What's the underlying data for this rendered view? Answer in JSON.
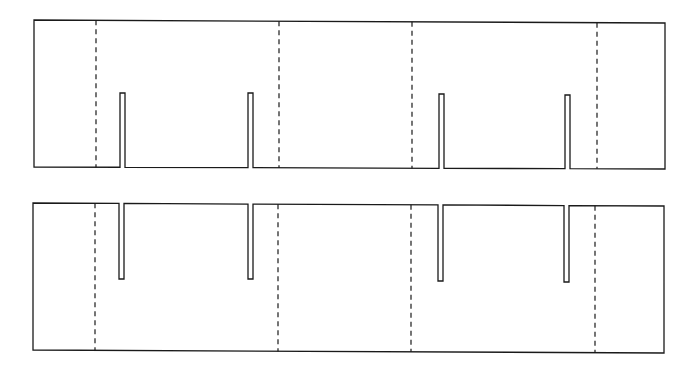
{
  "diagram": {
    "type": "die-cut template",
    "colors": {
      "line": "#1a1a1a",
      "background": "#ffffff"
    },
    "legend": {
      "cut_line": "solid",
      "fold_line": "dashed"
    },
    "panels": [
      {
        "id": "top-blank",
        "corners": {
          "tl": [
            34,
            20
          ],
          "tr": [
            665,
            23
          ],
          "br": [
            665,
            169
          ],
          "bl": [
            34,
            167
          ]
        },
        "slot_origin": "bottom",
        "slots": [
          {
            "x": 120,
            "w": 5,
            "tip_y": 93
          },
          {
            "x": 248,
            "w": 5,
            "tip_y": 93
          },
          {
            "x": 439,
            "w": 5,
            "tip_y": 94
          },
          {
            "x": 565,
            "w": 5,
            "tip_y": 95
          }
        ],
        "folds": [
          96,
          279,
          412,
          597
        ]
      },
      {
        "id": "bottom-blank",
        "corners": {
          "tl": [
            33,
            203
          ],
          "tr": [
            664,
            206
          ],
          "br": [
            664,
            353
          ],
          "bl": [
            33,
            350
          ]
        },
        "slot_origin": "top",
        "slots": [
          {
            "x": 119,
            "w": 5,
            "tip_y": 279
          },
          {
            "x": 248,
            "w": 5,
            "tip_y": 279
          },
          {
            "x": 438,
            "w": 5,
            "tip_y": 281
          },
          {
            "x": 564,
            "w": 5,
            "tip_y": 282
          }
        ],
        "folds": [
          95,
          278,
          411,
          595
        ]
      }
    ]
  }
}
